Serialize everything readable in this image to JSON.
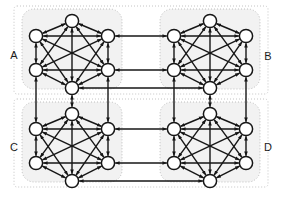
{
  "diagram": {
    "type": "graph-diagram",
    "canvas": {
      "width": 282,
      "height": 199
    },
    "colors": {
      "background": "#ffffff",
      "node_fill": "#ffffff",
      "node_stroke": "#161616",
      "edge": "#161616",
      "cluster_fill": "#f2f2f2",
      "cluster_stroke": "#b8b8b8",
      "outer_stroke": "#bdbdbd",
      "label_text": "#1a1a1a"
    },
    "style": {
      "node_radius": 6.6,
      "node_stroke_width": 1.5,
      "intra_edge_width": 1.4,
      "inter_edge_width": 1.4,
      "arrow_size": 3.4,
      "cluster_corner_radius": 12,
      "cluster_dash": "1,2",
      "outer_dash": "1,2"
    },
    "clusters": [
      {
        "id": "A",
        "label": "A",
        "label_pos": {
          "x": 14,
          "y": 56
        },
        "box": {
          "x": 22,
          "y": 9,
          "width": 100,
          "height": 80
        },
        "center": {
          "x": 72,
          "y": 49
        },
        "nodes": [
          {
            "id": "A0",
            "x": 72,
            "y": 21
          },
          {
            "id": "A1",
            "x": 36,
            "y": 36
          },
          {
            "id": "A2",
            "x": 108,
            "y": 36
          },
          {
            "id": "A3",
            "x": 36,
            "y": 70
          },
          {
            "id": "A4",
            "x": 108,
            "y": 70
          },
          {
            "id": "A5",
            "x": 72,
            "y": 88
          }
        ]
      },
      {
        "id": "B",
        "label": "B",
        "label_pos": {
          "x": 268,
          "y": 57
        },
        "box": {
          "x": 160,
          "y": 9,
          "width": 100,
          "height": 80
        },
        "center": {
          "x": 210,
          "y": 49
        },
        "nodes": [
          {
            "id": "B0",
            "x": 210,
            "y": 21
          },
          {
            "id": "B1",
            "x": 174,
            "y": 36
          },
          {
            "id": "B2",
            "x": 246,
            "y": 36
          },
          {
            "id": "B3",
            "x": 174,
            "y": 70
          },
          {
            "id": "B4",
            "x": 246,
            "y": 70
          },
          {
            "id": "B5",
            "x": 210,
            "y": 88
          }
        ]
      },
      {
        "id": "C",
        "label": "C",
        "label_pos": {
          "x": 14,
          "y": 148
        },
        "box": {
          "x": 22,
          "y": 102,
          "width": 100,
          "height": 80
        },
        "center": {
          "x": 72,
          "y": 142
        },
        "nodes": [
          {
            "id": "C0",
            "x": 72,
            "y": 114
          },
          {
            "id": "C1",
            "x": 36,
            "y": 129
          },
          {
            "id": "C2",
            "x": 108,
            "y": 129
          },
          {
            "id": "C3",
            "x": 36,
            "y": 163
          },
          {
            "id": "C4",
            "x": 108,
            "y": 163
          },
          {
            "id": "C5",
            "x": 72,
            "y": 181
          }
        ]
      },
      {
        "id": "D",
        "label": "D",
        "label_pos": {
          "x": 268,
          "y": 148
        },
        "box": {
          "x": 160,
          "y": 102,
          "width": 100,
          "height": 80
        },
        "center": {
          "x": 210,
          "y": 142
        },
        "nodes": [
          {
            "id": "D0",
            "x": 210,
            "y": 114
          },
          {
            "id": "D1",
            "x": 174,
            "y": 129
          },
          {
            "id": "D2",
            "x": 246,
            "y": 129
          },
          {
            "id": "D3",
            "x": 174,
            "y": 163
          },
          {
            "id": "D4",
            "x": 246,
            "y": 163
          },
          {
            "id": "D5",
            "x": 210,
            "y": 181
          }
        ]
      }
    ],
    "outer_boxes": [
      {
        "id": "top-half",
        "x": 14,
        "y": 6,
        "width": 254,
        "height": 88
      },
      {
        "id": "bottom-half",
        "x": 14,
        "y": 99,
        "width": 254,
        "height": 88
      }
    ],
    "intra_cluster_edges": [
      [
        "0",
        "1"
      ],
      [
        "0",
        "2"
      ],
      [
        "0",
        "3"
      ],
      [
        "0",
        "4"
      ],
      [
        "0",
        "5"
      ],
      [
        "1",
        "2"
      ],
      [
        "1",
        "3"
      ],
      [
        "1",
        "4"
      ],
      [
        "1",
        "5"
      ],
      [
        "2",
        "3"
      ],
      [
        "2",
        "4"
      ],
      [
        "2",
        "5"
      ],
      [
        "3",
        "4"
      ],
      [
        "3",
        "5"
      ],
      [
        "4",
        "5"
      ]
    ],
    "inter_cluster_edges": [
      {
        "from": "A2",
        "to": "B1",
        "kind": "horizontal"
      },
      {
        "from": "A4",
        "to": "B3",
        "kind": "horizontal"
      },
      {
        "from": "A5",
        "to": "B5",
        "kind": "horizontal"
      },
      {
        "from": "C2",
        "to": "D1",
        "kind": "horizontal"
      },
      {
        "from": "C4",
        "to": "D3",
        "kind": "horizontal"
      },
      {
        "from": "C5",
        "to": "D5",
        "kind": "horizontal"
      },
      {
        "from": "A3",
        "to": "C1",
        "kind": "vertical"
      },
      {
        "from": "A5",
        "to": "C0",
        "kind": "vertical"
      },
      {
        "from": "A4",
        "to": "C2",
        "kind": "vertical"
      },
      {
        "from": "B3",
        "to": "D1",
        "kind": "vertical"
      },
      {
        "from": "B5",
        "to": "D0",
        "kind": "vertical"
      },
      {
        "from": "B4",
        "to": "D2",
        "kind": "vertical"
      }
    ]
  }
}
